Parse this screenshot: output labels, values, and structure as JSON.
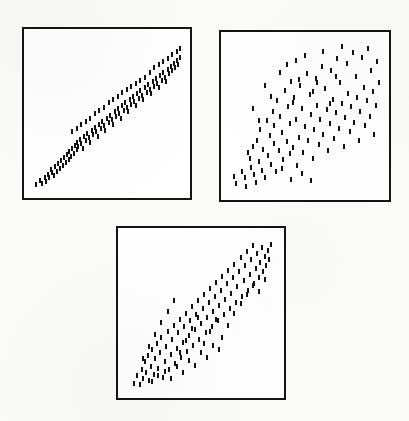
{
  "figure": {
    "background_color": "#fbfbf9",
    "ink_color": "#121212",
    "panel_border_color": "#141414",
    "panel_fill_color": "#ffffff",
    "point_glyph": "vertical-dash",
    "point_width_px": 2,
    "point_height_px": 5,
    "panel_count": 3
  },
  "panels": [
    {
      "id": "panel-top-left",
      "label": "Top-left scatterplot",
      "frame": {
        "x": 22,
        "y": 27,
        "width": 170,
        "height": 173
      },
      "border_width": 2
    },
    {
      "id": "panel-top-right",
      "label": "Top-right scatterplot",
      "frame": {
        "x": 219,
        "y": 30,
        "width": 172,
        "height": 172
      },
      "border_width": 2
    },
    {
      "id": "panel-bottom-center",
      "label": "Bottom-center scatterplot",
      "frame": {
        "x": 116,
        "y": 226,
        "width": 170,
        "height": 174
      },
      "border_width": 2
    }
  ],
  "chart_data": [
    {
      "type": "scatter",
      "id": "panel-top-left",
      "title": "",
      "xlabel": "",
      "ylabel": "",
      "xlim": [
        0,
        100
      ],
      "ylim": [
        0,
        100
      ],
      "grid": false,
      "legend": "none",
      "axis_ticks": "none",
      "marker": "vertical-dash",
      "description": "Strong positive linear association; tight narrow band from lower-left to upper-right",
      "n_points": 118,
      "points": [
        [
          3,
          3
        ],
        [
          6,
          6
        ],
        [
          7,
          4
        ],
        [
          9,
          8
        ],
        [
          10,
          5
        ],
        [
          11,
          10
        ],
        [
          12,
          8
        ],
        [
          13,
          13
        ],
        [
          14,
          11
        ],
        [
          15,
          9
        ],
        [
          16,
          15
        ],
        [
          17,
          12
        ],
        [
          18,
          17
        ],
        [
          19,
          14
        ],
        [
          20,
          19
        ],
        [
          21,
          16
        ],
        [
          22,
          21
        ],
        [
          23,
          18
        ],
        [
          24,
          23
        ],
        [
          25,
          20
        ],
        [
          25,
          25
        ],
        [
          26,
          22
        ],
        [
          27,
          27
        ],
        [
          28,
          24
        ],
        [
          29,
          29
        ],
        [
          30,
          26
        ],
        [
          30,
          31
        ],
        [
          31,
          28
        ],
        [
          32,
          33
        ],
        [
          33,
          30
        ],
        [
          34,
          27
        ],
        [
          35,
          35
        ],
        [
          36,
          32
        ],
        [
          37,
          37
        ],
        [
          38,
          34
        ],
        [
          39,
          31
        ],
        [
          40,
          39
        ],
        [
          41,
          36
        ],
        [
          42,
          41
        ],
        [
          43,
          38
        ],
        [
          44,
          35
        ],
        [
          45,
          43
        ],
        [
          46,
          40
        ],
        [
          47,
          45
        ],
        [
          48,
          42
        ],
        [
          49,
          39
        ],
        [
          50,
          47
        ],
        [
          51,
          44
        ],
        [
          52,
          49
        ],
        [
          53,
          46
        ],
        [
          54,
          43
        ],
        [
          55,
          51
        ],
        [
          56,
          48
        ],
        [
          57,
          53
        ],
        [
          58,
          50
        ],
        [
          59,
          47
        ],
        [
          60,
          55
        ],
        [
          61,
          52
        ],
        [
          62,
          57
        ],
        [
          63,
          54
        ],
        [
          64,
          51
        ],
        [
          65,
          59
        ],
        [
          66,
          56
        ],
        [
          67,
          61
        ],
        [
          68,
          58
        ],
        [
          69,
          55
        ],
        [
          70,
          63
        ],
        [
          71,
          60
        ],
        [
          72,
          65
        ],
        [
          73,
          62
        ],
        [
          74,
          59
        ],
        [
          75,
          67
        ],
        [
          76,
          64
        ],
        [
          77,
          69
        ],
        [
          78,
          66
        ],
        [
          79,
          63
        ],
        [
          80,
          71
        ],
        [
          81,
          68
        ],
        [
          82,
          73
        ],
        [
          83,
          70
        ],
        [
          84,
          67
        ],
        [
          85,
          75
        ],
        [
          86,
          72
        ],
        [
          87,
          77
        ],
        [
          88,
          74
        ],
        [
          89,
          71
        ],
        [
          90,
          79
        ],
        [
          91,
          76
        ],
        [
          92,
          81
        ],
        [
          93,
          78
        ],
        [
          94,
          83
        ],
        [
          95,
          80
        ],
        [
          96,
          85
        ],
        [
          97,
          82
        ],
        [
          98,
          87
        ],
        [
          98,
          93
        ],
        [
          96,
          91
        ],
        [
          93,
          89
        ],
        [
          90,
          86
        ],
        [
          87,
          84
        ],
        [
          84,
          82
        ],
        [
          81,
          80
        ],
        [
          78,
          77
        ],
        [
          75,
          74
        ],
        [
          72,
          72
        ],
        [
          69,
          70
        ],
        [
          66,
          68
        ],
        [
          63,
          66
        ],
        [
          60,
          64
        ],
        [
          57,
          61
        ],
        [
          54,
          59
        ],
        [
          51,
          57
        ],
        [
          48,
          54
        ],
        [
          45,
          52
        ],
        [
          42,
          50
        ],
        [
          39,
          47
        ],
        [
          36,
          45
        ],
        [
          33,
          43
        ],
        [
          30,
          40
        ],
        [
          27,
          38
        ]
      ]
    },
    {
      "type": "scatter",
      "id": "panel-top-right",
      "title": "",
      "xlabel": "",
      "ylabel": "",
      "xlim": [
        0,
        100
      ],
      "ylim": [
        0,
        100
      ],
      "grid": false,
      "legend": "none",
      "axis_ticks": "none",
      "marker": "vertical-dash",
      "description": "Weak to moderate positive association; broad diffuse cloud with wide vertical spread",
      "n_points": 112,
      "points": [
        [
          4,
          10
        ],
        [
          5,
          5
        ],
        [
          9,
          13
        ],
        [
          11,
          9
        ],
        [
          12,
          3
        ],
        [
          13,
          26
        ],
        [
          14,
          22
        ],
        [
          15,
          16
        ],
        [
          16,
          30
        ],
        [
          17,
          11
        ],
        [
          18,
          6
        ],
        [
          19,
          34
        ],
        [
          20,
          20
        ],
        [
          21,
          41
        ],
        [
          22,
          14
        ],
        [
          23,
          28
        ],
        [
          24,
          9
        ],
        [
          25,
          47
        ],
        [
          26,
          24
        ],
        [
          27,
          37
        ],
        [
          28,
          18
        ],
        [
          29,
          53
        ],
        [
          30,
          32
        ],
        [
          30,
          44
        ],
        [
          31,
          13
        ],
        [
          32,
          60
        ],
        [
          33,
          27
        ],
        [
          34,
          50
        ],
        [
          35,
          39
        ],
        [
          36,
          21
        ],
        [
          37,
          67
        ],
        [
          38,
          33
        ],
        [
          39,
          56
        ],
        [
          40,
          45
        ],
        [
          40,
          25
        ],
        [
          41,
          73
        ],
        [
          42,
          29
        ],
        [
          43,
          62
        ],
        [
          44,
          48
        ],
        [
          45,
          17
        ],
        [
          46,
          36
        ],
        [
          47,
          70
        ],
        [
          48,
          55
        ],
        [
          49,
          26
        ],
        [
          50,
          43
        ],
        [
          51,
          78
        ],
        [
          52,
          34
        ],
        [
          53,
          64
        ],
        [
          54,
          51
        ],
        [
          55,
          22
        ],
        [
          56,
          41
        ],
        [
          57,
          75
        ],
        [
          58,
          57
        ],
        [
          59,
          31
        ],
        [
          60,
          48
        ],
        [
          61,
          83
        ],
        [
          62,
          38
        ],
        [
          63,
          68
        ],
        [
          64,
          54
        ],
        [
          65,
          27
        ],
        [
          66,
          45
        ],
        [
          67,
          80
        ],
        [
          68,
          61
        ],
        [
          69,
          35
        ],
        [
          70,
          52
        ],
        [
          71,
          88
        ],
        [
          72,
          42
        ],
        [
          73,
          72
        ],
        [
          74,
          58
        ],
        [
          75,
          30
        ],
        [
          76,
          49
        ],
        [
          77,
          85
        ],
        [
          78,
          65
        ],
        [
          79,
          40
        ],
        [
          80,
          56
        ],
        [
          81,
          92
        ],
        [
          82,
          46
        ],
        [
          83,
          76
        ],
        [
          84,
          62
        ],
        [
          85,
          34
        ],
        [
          86,
          53
        ],
        [
          87,
          89
        ],
        [
          88,
          69
        ],
        [
          89,
          44
        ],
        [
          90,
          60
        ],
        [
          91,
          95
        ],
        [
          92,
          50
        ],
        [
          93,
          80
        ],
        [
          94,
          66
        ],
        [
          95,
          38
        ],
        [
          96,
          57
        ],
        [
          97,
          86
        ],
        [
          98,
          72
        ],
        [
          34,
          79
        ],
        [
          38,
          84
        ],
        [
          44,
          87
        ],
        [
          50,
          90
        ],
        [
          55,
          66
        ],
        [
          58,
          72
        ],
        [
          62,
          93
        ],
        [
          66,
          58
        ],
        [
          70,
          76
        ],
        [
          74,
          96
        ],
        [
          42,
          59
        ],
        [
          46,
          74
        ],
        [
          28,
          63
        ],
        [
          24,
          70
        ],
        [
          20,
          47
        ],
        [
          16,
          55
        ],
        [
          35,
          15
        ],
        [
          41,
          8
        ],
        [
          48,
          12
        ],
        [
          54,
          7
        ]
      ]
    },
    {
      "type": "scatter",
      "id": "panel-bottom-center",
      "title": "",
      "xlabel": "",
      "ylabel": "",
      "xlim": [
        0,
        100
      ],
      "ylim": [
        0,
        100
      ],
      "grid": false,
      "legend": "none",
      "axis_ticks": "none",
      "marker": "vertical-dash",
      "description": "Moderate to strong positive association; elongated diagonal cloud with moderate scatter",
      "n_points": 120,
      "points": [
        [
          6,
          4
        ],
        [
          8,
          9
        ],
        [
          10,
          3
        ],
        [
          11,
          13
        ],
        [
          12,
          7
        ],
        [
          13,
          18
        ],
        [
          14,
          11
        ],
        [
          15,
          22
        ],
        [
          16,
          6
        ],
        [
          17,
          15
        ],
        [
          18,
          26
        ],
        [
          19,
          10
        ],
        [
          20,
          20
        ],
        [
          21,
          30
        ],
        [
          22,
          14
        ],
        [
          23,
          24
        ],
        [
          24,
          34
        ],
        [
          25,
          8
        ],
        [
          26,
          18
        ],
        [
          27,
          28
        ],
        [
          28,
          38
        ],
        [
          29,
          13
        ],
        [
          30,
          23
        ],
        [
          31,
          33
        ],
        [
          32,
          42
        ],
        [
          33,
          17
        ],
        [
          34,
          27
        ],
        [
          35,
          37
        ],
        [
          36,
          46
        ],
        [
          37,
          21
        ],
        [
          38,
          31
        ],
        [
          39,
          41
        ],
        [
          40,
          50
        ],
        [
          41,
          25
        ],
        [
          42,
          35
        ],
        [
          43,
          45
        ],
        [
          44,
          54
        ],
        [
          45,
          29
        ],
        [
          46,
          39
        ],
        [
          47,
          49
        ],
        [
          48,
          58
        ],
        [
          49,
          33
        ],
        [
          50,
          43
        ],
        [
          51,
          53
        ],
        [
          52,
          62
        ],
        [
          53,
          37
        ],
        [
          54,
          47
        ],
        [
          55,
          57
        ],
        [
          56,
          66
        ],
        [
          57,
          41
        ],
        [
          58,
          51
        ],
        [
          59,
          61
        ],
        [
          60,
          70
        ],
        [
          61,
          45
        ],
        [
          62,
          55
        ],
        [
          63,
          65
        ],
        [
          64,
          74
        ],
        [
          65,
          49
        ],
        [
          66,
          59
        ],
        [
          67,
          69
        ],
        [
          68,
          78
        ],
        [
          69,
          53
        ],
        [
          70,
          63
        ],
        [
          71,
          73
        ],
        [
          72,
          82
        ],
        [
          73,
          57
        ],
        [
          74,
          67
        ],
        [
          75,
          77
        ],
        [
          76,
          86
        ],
        [
          77,
          61
        ],
        [
          78,
          71
        ],
        [
          79,
          81
        ],
        [
          80,
          90
        ],
        [
          81,
          65
        ],
        [
          82,
          75
        ],
        [
          83,
          85
        ],
        [
          84,
          94
        ],
        [
          85,
          69
        ],
        [
          86,
          79
        ],
        [
          87,
          89
        ],
        [
          88,
          73
        ],
        [
          89,
          83
        ],
        [
          90,
          93
        ],
        [
          91,
          77
        ],
        [
          92,
          87
        ],
        [
          93,
          81
        ],
        [
          94,
          91
        ],
        [
          95,
          85
        ],
        [
          96,
          95
        ],
        [
          12,
          20
        ],
        [
          16,
          28
        ],
        [
          20,
          36
        ],
        [
          24,
          44
        ],
        [
          28,
          51
        ],
        [
          32,
          58
        ],
        [
          36,
          24
        ],
        [
          40,
          32
        ],
        [
          44,
          40
        ],
        [
          48,
          47
        ],
        [
          52,
          30
        ],
        [
          56,
          38
        ],
        [
          60,
          46
        ],
        [
          64,
          34
        ],
        [
          68,
          42
        ],
        [
          72,
          50
        ],
        [
          76,
          56
        ],
        [
          80,
          62
        ],
        [
          84,
          68
        ],
        [
          88,
          64
        ],
        [
          92,
          72
        ],
        [
          18,
          5
        ],
        [
          22,
          9
        ],
        [
          26,
          12
        ],
        [
          30,
          7
        ],
        [
          34,
          15
        ],
        [
          38,
          11
        ],
        [
          42,
          19
        ],
        [
          46,
          16
        ],
        [
          50,
          24
        ],
        [
          54,
          21
        ],
        [
          58,
          29
        ],
        [
          62,
          26
        ]
      ]
    }
  ]
}
